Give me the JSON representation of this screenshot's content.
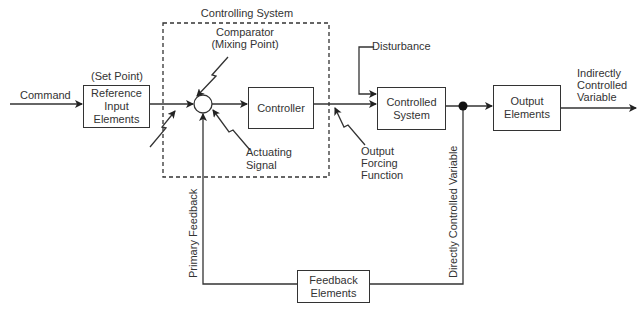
{
  "diagram": {
    "title": "Controlling System",
    "blocks": {
      "reference": "Reference Input Elements",
      "controller": "Controller",
      "controlled_system": "Controlled System",
      "output_elements": "Output Elements",
      "feedback_elements": "Feedback Elements"
    },
    "block_lines": {
      "reference": [
        "Reference",
        "Input",
        "Elements"
      ],
      "controlled_system": [
        "Controlled",
        "System"
      ],
      "output_elements": [
        "Output",
        "Elements"
      ],
      "feedback_elements": [
        "Feedback",
        "Elements"
      ]
    },
    "labels": {
      "command": "Command",
      "set_point": "(Set Point)",
      "comparator": "Comparator",
      "mixing_point": "(Mixing Point)",
      "actuating_1": "Actuating",
      "actuating_2": "Signal",
      "output_forcing_1": "Output",
      "output_forcing_2": "Forcing",
      "output_forcing_3": "Function",
      "disturbance": "Disturbance",
      "indirect_1": "Indirectly",
      "indirect_2": "Controlled",
      "indirect_3": "Variable",
      "primary_feedback": "Primary Feedback",
      "directly_controlled": "Directly Controlled Variable"
    },
    "colors": {
      "line": "#333333",
      "background": "#ffffff"
    }
  }
}
